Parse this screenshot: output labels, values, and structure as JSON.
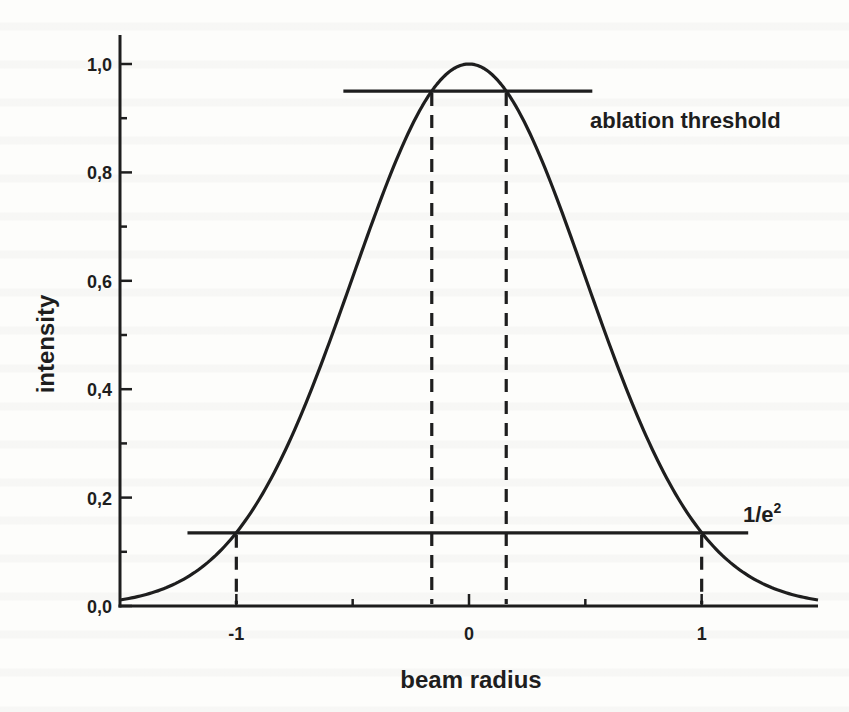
{
  "chart_data": {
    "type": "line",
    "title": "",
    "xlabel": "beam radius",
    "ylabel": "intensity",
    "xlim": [
      -1.5,
      1.5
    ],
    "ylim": [
      0.0,
      1.05
    ],
    "grid": false,
    "legend": null,
    "x_ticks": [
      {
        "value": -1,
        "label": "-1",
        "major": true
      },
      {
        "value": -0.5,
        "label": "",
        "major": false
      },
      {
        "value": 0,
        "label": "0",
        "major": true
      },
      {
        "value": 0.5,
        "label": "",
        "major": false
      },
      {
        "value": 1,
        "label": "1",
        "major": true
      }
    ],
    "y_ticks": [
      {
        "value": 0.0,
        "label": "0,0",
        "major": true
      },
      {
        "value": 0.1,
        "label": "",
        "major": false
      },
      {
        "value": 0.2,
        "label": "0,2",
        "major": true
      },
      {
        "value": 0.3,
        "label": "",
        "major": false
      },
      {
        "value": 0.4,
        "label": "0,4",
        "major": true
      },
      {
        "value": 0.5,
        "label": "",
        "major": false
      },
      {
        "value": 0.6,
        "label": "0,6",
        "major": true
      },
      {
        "value": 0.7,
        "label": "",
        "major": false
      },
      {
        "value": 0.8,
        "label": "0,8",
        "major": true
      },
      {
        "value": 0.9,
        "label": "",
        "major": false
      },
      {
        "value": 1.0,
        "label": "1,0",
        "major": true
      }
    ],
    "series": [
      {
        "name": "gaussian beam profile",
        "function": "exp(-2*x^2)",
        "x": [
          -1.5,
          -1.25,
          -1.0,
          -0.75,
          -0.5,
          -0.25,
          -0.16,
          0.0,
          0.16,
          0.25,
          0.5,
          0.75,
          1.0,
          1.25,
          1.5
        ],
        "y": [
          0.011,
          0.044,
          0.135,
          0.325,
          0.607,
          0.882,
          0.95,
          1.0,
          0.95,
          0.882,
          0.607,
          0.325,
          0.135,
          0.044,
          0.011
        ]
      }
    ],
    "annotations": [
      {
        "type": "hline",
        "name": "ablation threshold",
        "y": 0.95,
        "x_from": -0.54,
        "x_to": 0.53,
        "label": "ablation threshold"
      },
      {
        "type": "hline",
        "name": "1/e2 level",
        "y": 0.135,
        "x_from": -1.21,
        "x_to": 1.2,
        "label": "1/e²"
      },
      {
        "type": "vline-dashed",
        "x": -0.16,
        "y_from": 0.95,
        "y_to": 0.0
      },
      {
        "type": "vline-dashed",
        "x": 0.16,
        "y_from": 0.95,
        "y_to": 0.0
      },
      {
        "type": "vline-dashed",
        "x": -1.0,
        "y_from": 0.135,
        "y_to": 0.0
      },
      {
        "type": "vline-dashed",
        "x": 1.0,
        "y_from": 0.135,
        "y_to": 0.0
      }
    ]
  },
  "labels": {
    "ylabel": "intensity",
    "xlabel": "beam radius",
    "threshold": "ablation threshold",
    "inv_e2_base": "1/e",
    "inv_e2_sup": "2"
  },
  "colors": {
    "ink": "#1e1e1e",
    "paper": "#fdfdfb"
  }
}
